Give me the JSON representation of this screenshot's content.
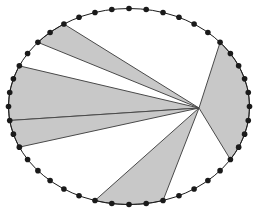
{
  "figure": {
    "canvas": {
      "width": 258,
      "height": 213,
      "background": "#ffffff"
    },
    "ellipse": {
      "cx": 129,
      "cy": 106.5,
      "rx": 120.5,
      "ry": 98.0,
      "stroke": "#1a1a1a",
      "stroke_width": 1.0,
      "fill": "none"
    },
    "apex": {
      "x": 199.0,
      "y": 108.0,
      "label": "convergence-point"
    },
    "style": {
      "wedge_fill": "#c8c8c8",
      "wedge_stroke": "#4a4a4a",
      "wedge_stroke_width": 1.0,
      "dot_fill": "#1a1a1a",
      "dot_radius": 2.8,
      "dot_count": 44
    },
    "dots_deg": [
      0,
      8.2,
      16.4,
      24.5,
      32.7,
      40.9,
      49.1,
      57.3,
      65.5,
      73.6,
      81.8,
      90,
      98.2,
      106.4,
      114.5,
      122.7,
      130.9,
      139.1,
      147.3,
      155.5,
      163.6,
      171.8,
      180,
      188.2,
      196.4,
      204.5,
      212.7,
      220.9,
      229.1,
      237.3,
      245.5,
      253.6,
      261.8,
      270,
      278.2,
      286.4,
      294.5,
      302.7,
      310.9,
      319.1,
      327.3,
      335.5,
      343.6,
      351.8
    ],
    "wedges": [
      {
        "name": "wedge-upper-left-wide",
        "start_deg": 155.5,
        "end_deg": 188.2,
        "fill": "#c8c8c8"
      },
      {
        "name": "wedge-upper-mid-narrow",
        "start_deg": 188.2,
        "end_deg": 204.5,
        "fill": "#c8c8c8"
      },
      {
        "name": "wedge-left-slim",
        "start_deg": 122.7,
        "end_deg": 139.1,
        "fill": "#c8c8c8"
      },
      {
        "name": "wedge-lower-left",
        "start_deg": 253.6,
        "end_deg": 286.4,
        "fill": "#c8c8c8"
      },
      {
        "name": "wedge-right-broad",
        "start_deg": 327.3,
        "end_deg": 40.9,
        "fill": "#c8c8c8"
      }
    ]
  }
}
